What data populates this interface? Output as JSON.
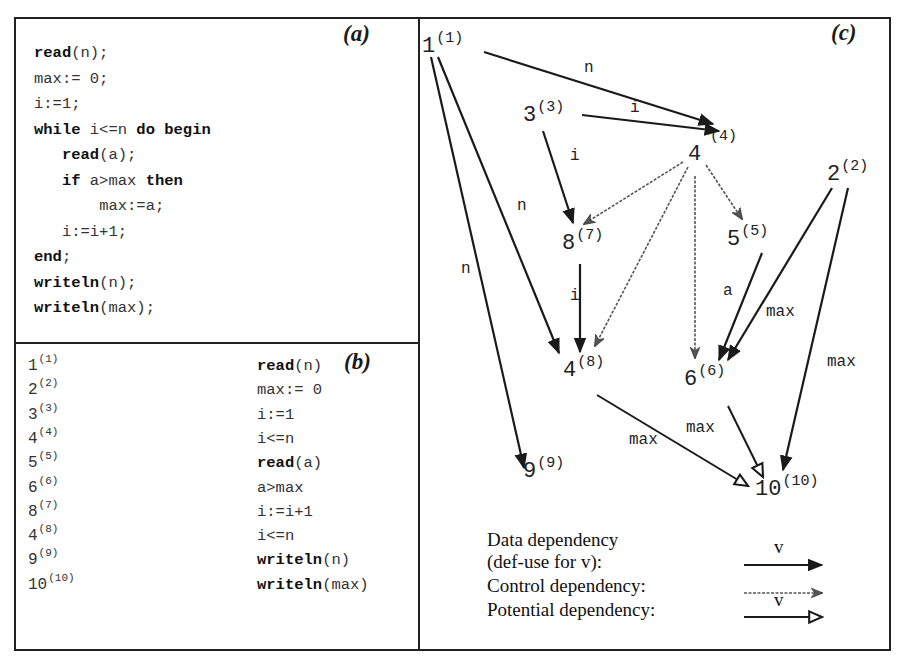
{
  "panels": {
    "a": {
      "label": "(a)",
      "code_lines": [
        {
          "indent": "",
          "parts": [
            {
              "t": "read",
              "b": true
            },
            {
              "t": "(n);",
              "b": false
            }
          ]
        },
        {
          "indent": "",
          "parts": [
            {
              "t": "max:= 0;",
              "b": false
            }
          ]
        },
        {
          "indent": "",
          "parts": [
            {
              "t": "i:=1;",
              "b": false
            }
          ]
        },
        {
          "indent": "",
          "parts": [
            {
              "t": "while",
              "b": true
            },
            {
              "t": " i<=n ",
              "b": false
            },
            {
              "t": "do begin",
              "b": true
            }
          ]
        },
        {
          "indent": "   ",
          "parts": [
            {
              "t": "read",
              "b": true
            },
            {
              "t": "(a);",
              "b": false
            }
          ]
        },
        {
          "indent": "   ",
          "parts": [
            {
              "t": "if",
              "b": true
            },
            {
              "t": " a>max ",
              "b": false
            },
            {
              "t": "then",
              "b": true
            }
          ]
        },
        {
          "indent": "       ",
          "parts": [
            {
              "t": "max:=a;",
              "b": false
            }
          ]
        },
        {
          "indent": "   ",
          "parts": [
            {
              "t": "i:=i+1;",
              "b": false
            }
          ]
        },
        {
          "indent": "",
          "parts": [
            {
              "t": "end",
              "b": true
            },
            {
              "t": ";",
              "b": false
            }
          ]
        },
        {
          "indent": "",
          "parts": [
            {
              "t": "writeln",
              "b": true
            },
            {
              "t": "(n);",
              "b": false
            }
          ]
        },
        {
          "indent": "",
          "parts": [
            {
              "t": "writeln",
              "b": true
            },
            {
              "t": "(max);",
              "b": false
            }
          ]
        }
      ]
    },
    "b": {
      "label": "(b)",
      "statements": [
        {
          "num": "1",
          "occ": "(1)",
          "parts": [
            {
              "t": "read",
              "b": true
            },
            {
              "t": "(n)",
              "b": false
            }
          ]
        },
        {
          "num": "2",
          "occ": "(2)",
          "parts": [
            {
              "t": "max:= 0",
              "b": false
            }
          ]
        },
        {
          "num": "3",
          "occ": "(3)",
          "parts": [
            {
              "t": "i:=1",
              "b": false
            }
          ]
        },
        {
          "num": "4",
          "occ": "(4)",
          "parts": [
            {
              "t": "i<=n",
              "b": false
            }
          ]
        },
        {
          "num": "5",
          "occ": "(5)",
          "parts": [
            {
              "t": "read",
              "b": true
            },
            {
              "t": "(a)",
              "b": false
            }
          ]
        },
        {
          "num": "6",
          "occ": "(6)",
          "parts": [
            {
              "t": "a>max",
              "b": false
            }
          ]
        },
        {
          "num": "8",
          "occ": "(7)",
          "parts": [
            {
              "t": "i:=i+1",
              "b": false
            }
          ]
        },
        {
          "num": "4",
          "occ": "(8)",
          "parts": [
            {
              "t": "i<=n",
              "b": false
            }
          ]
        },
        {
          "num": "9",
          "occ": "(9)",
          "parts": [
            {
              "t": "writeln",
              "b": true
            },
            {
              "t": "(n)",
              "b": false
            }
          ]
        },
        {
          "num": "10",
          "occ": "(10)",
          "parts": [
            {
              "t": "writeln",
              "b": true
            },
            {
              "t": "(max)",
              "b": false
            }
          ]
        }
      ]
    },
    "c": {
      "label": "(c)",
      "nodes": [
        {
          "id": "n1",
          "num": "1",
          "occ": "(1)",
          "x": 422,
          "y": 52
        },
        {
          "id": "n3",
          "num": "3",
          "occ": "(3)",
          "x": 523,
          "y": 121
        },
        {
          "id": "n4a",
          "num": "4",
          "occ": "(4)",
          "x": 688,
          "y": 160,
          "occ_dx": 22,
          "occ_dy": -20
        },
        {
          "id": "n2",
          "num": "2",
          "occ": "(2)",
          "x": 827,
          "y": 180
        },
        {
          "id": "n8",
          "num": "8",
          "occ": "(7)",
          "x": 562,
          "y": 249
        },
        {
          "id": "n5",
          "num": "5",
          "occ": "(5)",
          "x": 727,
          "y": 245
        },
        {
          "id": "n4b",
          "num": "4",
          "occ": "(8)",
          "x": 563,
          "y": 376
        },
        {
          "id": "n6",
          "num": "6",
          "occ": "(6)",
          "x": 684,
          "y": 385
        },
        {
          "id": "n9",
          "num": "9",
          "occ": "(9)",
          "x": 523,
          "y": 477
        },
        {
          "id": "n10",
          "num": "10",
          "occ": "(10)",
          "x": 755,
          "y": 495
        }
      ],
      "edges": [
        {
          "from": "n1",
          "to": "n4a",
          "kind": "data",
          "label": "n",
          "x1": 484,
          "y1": 52,
          "x2": 713,
          "y2": 124,
          "lx": 584,
          "ly": 72
        },
        {
          "from": "n3",
          "to": "n4a",
          "kind": "data",
          "label": "i",
          "x1": 582,
          "y1": 115,
          "x2": 719,
          "y2": 131,
          "lx": 630,
          "ly": 112
        },
        {
          "from": "n1",
          "to": "n8",
          "kind": "data",
          "label": "i",
          "x1": 0,
          "y1": 0,
          "x2": 0,
          "y2": 0,
          "hidden": true
        },
        {
          "from": "n3",
          "to": "n8",
          "kind": "data",
          "label": "i",
          "x1": 543,
          "y1": 131,
          "x2": 573,
          "y2": 223,
          "lx": 570,
          "ly": 160
        },
        {
          "from": "n1",
          "to": "n4b",
          "kind": "data",
          "label": "n",
          "x1": 438,
          "y1": 57,
          "x2": 559,
          "y2": 353,
          "lx": 517,
          "ly": 210
        },
        {
          "from": "n1",
          "to": "n9",
          "kind": "data",
          "label": "n",
          "x1": 431,
          "y1": 57,
          "x2": 524,
          "y2": 468,
          "lx": 461,
          "ly": 273
        },
        {
          "from": "n8",
          "to": "n4b",
          "kind": "data",
          "label": "i",
          "x1": 580,
          "y1": 264,
          "x2": 580,
          "y2": 352,
          "lx": 570,
          "ly": 300
        },
        {
          "from": "n4a",
          "to": "n8",
          "kind": "control",
          "label": "",
          "x1": 683,
          "y1": 162,
          "x2": 584,
          "y2": 224
        },
        {
          "from": "n4a",
          "to": "n4b",
          "kind": "control",
          "label": "",
          "x1": 688,
          "y1": 167,
          "x2": 595,
          "y2": 346
        },
        {
          "from": "n4a",
          "to": "n6",
          "kind": "control",
          "label": "",
          "x1": 695,
          "y1": 176,
          "x2": 695,
          "y2": 358
        },
        {
          "from": "n4a",
          "to": "n5",
          "kind": "control",
          "label": "",
          "x1": 706,
          "y1": 165,
          "x2": 742,
          "y2": 219
        },
        {
          "from": "n5",
          "to": "n6",
          "kind": "data",
          "label": "a",
          "x1": 762,
          "y1": 253,
          "x2": 719,
          "y2": 360,
          "lx": 723,
          "ly": 295
        },
        {
          "from": "n2",
          "to": "n6",
          "kind": "data",
          "label": "max",
          "x1": 832,
          "y1": 188,
          "x2": 728,
          "y2": 360,
          "lx": 766,
          "ly": 316
        },
        {
          "from": "n2",
          "to": "n10",
          "kind": "data",
          "label": "max",
          "x1": 848,
          "y1": 188,
          "x2": 783,
          "y2": 470,
          "lx": 827,
          "ly": 366
        },
        {
          "from": "n4b",
          "to": "n10",
          "kind": "potential",
          "label": "max",
          "x1": 597,
          "y1": 395,
          "x2": 748,
          "y2": 486,
          "lx": 629,
          "ly": 444
        },
        {
          "from": "n6",
          "to": "n10",
          "kind": "potential",
          "label": "max",
          "x1": 728,
          "y1": 406,
          "x2": 763,
          "y2": 477,
          "lx": 686,
          "ly": 432
        }
      ],
      "legend": [
        {
          "kind": "data",
          "text_lines": [
            "Data dependency",
            "(def-use for v):"
          ],
          "arrow_label": "v"
        },
        {
          "kind": "control",
          "text_lines": [
            "Control dependency:"
          ],
          "arrow_label": ""
        },
        {
          "kind": "potential",
          "text_lines": [
            "Potential dependency:"
          ],
          "arrow_label": "v"
        }
      ]
    }
  },
  "colors": {
    "stroke": "#1a1a1a",
    "control": "#555555",
    "text": "#222222"
  }
}
